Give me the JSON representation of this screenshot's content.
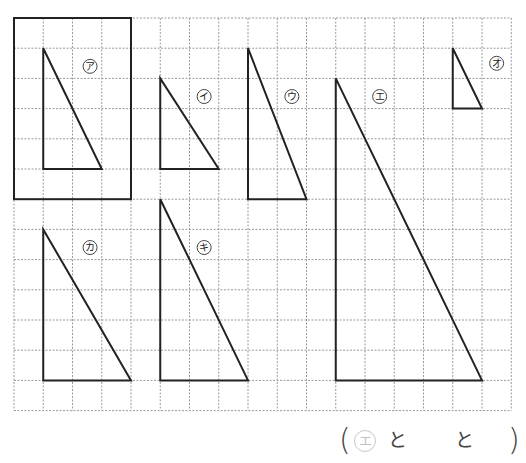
{
  "grid": {
    "origin_x": 14,
    "origin_y": 18,
    "cell_w": 29.25,
    "cell_h": 30.2,
    "cols": 17,
    "rows": 13,
    "line_color": "#9a9a9a",
    "stroke_color": "#222222"
  },
  "highlight_box": {
    "label": "reference-box",
    "col": 0,
    "row": 0,
    "w": 4,
    "h": 6
  },
  "triangles": [
    {
      "id": "a",
      "label": "ア",
      "points": [
        [
          1,
          1
        ],
        [
          1,
          5
        ],
        [
          3,
          5
        ]
      ],
      "label_pos": [
        2.6,
        1.6
      ]
    },
    {
      "id": "i",
      "label": "イ",
      "points": [
        [
          5,
          2
        ],
        [
          5,
          5
        ],
        [
          7,
          5
        ]
      ],
      "label_pos": [
        6.5,
        2.6
      ]
    },
    {
      "id": "u",
      "label": "ウ",
      "points": [
        [
          8,
          1
        ],
        [
          8,
          6
        ],
        [
          10,
          6
        ]
      ],
      "label_pos": [
        9.5,
        2.6
      ]
    },
    {
      "id": "e",
      "label": "エ",
      "points": [
        [
          11,
          2
        ],
        [
          11,
          12
        ],
        [
          16,
          12
        ]
      ],
      "label_pos": [
        12.5,
        2.6
      ]
    },
    {
      "id": "o",
      "label": "オ",
      "points": [
        [
          15,
          1
        ],
        [
          15,
          3
        ],
        [
          16,
          3
        ]
      ],
      "label_pos": [
        16.5,
        1.5
      ]
    },
    {
      "id": "ka",
      "label": "カ",
      "points": [
        [
          1,
          7
        ],
        [
          1,
          12
        ],
        [
          4,
          12
        ]
      ],
      "label_pos": [
        2.6,
        7.6
      ]
    },
    {
      "id": "ki",
      "label": "キ",
      "points": [
        [
          5,
          6
        ],
        [
          5,
          12
        ],
        [
          8,
          12
        ]
      ],
      "label_pos": [
        6.5,
        7.6
      ]
    }
  ],
  "answer": {
    "open_paren": "(",
    "filled": "エ",
    "connector_1": "と",
    "connector_2": "と",
    "close_paren": ")"
  }
}
